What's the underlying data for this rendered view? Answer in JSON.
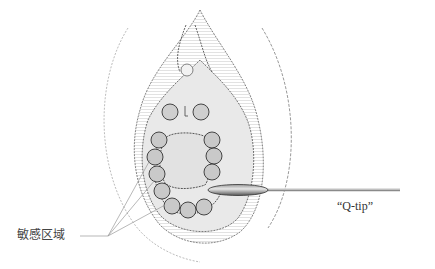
{
  "diagram": {
    "labels": {
      "sensitive_zone": "敏感区域",
      "qtip": "“Q-tip”"
    },
    "colors": {
      "line": "#3a3a3a",
      "shade": "#d8d8d8",
      "light_shade": "#ececec",
      "background": "#ffffff"
    },
    "touch_points": {
      "count": 16,
      "description": "numbered-like circles around opening indicating test points"
    }
  }
}
